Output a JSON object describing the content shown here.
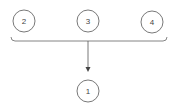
{
  "diagram": {
    "nodes": [
      {
        "id": "2",
        "label": "2",
        "cx": 24,
        "cy": 21
      },
      {
        "id": "3",
        "label": "3",
        "cx": 88,
        "cy": 21
      },
      {
        "id": "4",
        "label": "4",
        "cx": 152,
        "cy": 22
      },
      {
        "id": "1",
        "label": "1",
        "cx": 88,
        "cy": 91
      }
    ],
    "edges": [
      {
        "from": [
          "2",
          "3",
          "4"
        ],
        "to": "1",
        "type": "merge-arrow"
      }
    ],
    "colors": {
      "stroke": "#555555",
      "text": "#444444",
      "background": "#ffffff"
    }
  }
}
